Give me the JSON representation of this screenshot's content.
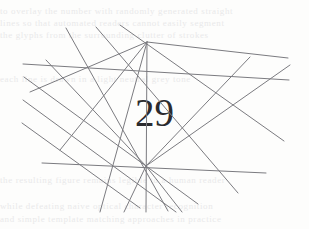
{
  "image": {
    "kind": "captcha-image",
    "width": 309,
    "height": 229,
    "background_color": "#fdfdfc",
    "line_color": "#7b7b80",
    "digit_color": "#2b2b2e",
    "ghost_color": "#e9e9ea",
    "alt_text": "Distorted number obscured by crossing lines"
  },
  "captcha": {
    "value": "29",
    "digit_count": 2
  },
  "ghost_text": {
    "line_1": "to overlay the number with randomly generated straight",
    "line_2": "lines so that automated readers cannot easily segment",
    "line_3": "the glyphs from the surrounding clutter of strokes",
    "line_4": "each line is drawn in a light neutral grey tone",
    "line_5": "the resulting figure remains legible to a human reader",
    "line_6": "while defeating naive optical character recognition",
    "line_7": "and simple template matching approaches in practice"
  },
  "chart_data": {
    "type": "scatter",
    "xlabel": "",
    "ylabel": "",
    "xlim": [
      0,
      309
    ],
    "ylim": [
      0,
      229
    ],
    "grid": false,
    "legend": "none",
    "line_width": 1,
    "line_color": "#7b7b80",
    "segments": [
      {
        "name": "seg-01",
        "x1": 23,
        "y1": 64,
        "x2": 289,
        "y2": 80
      },
      {
        "name": "seg-02",
        "x1": 42,
        "y1": 163,
        "x2": 266,
        "y2": 173
      },
      {
        "name": "seg-03",
        "x1": 24,
        "y1": 77,
        "x2": 198,
        "y2": 204
      },
      {
        "name": "seg-04",
        "x1": 23,
        "y1": 100,
        "x2": 176,
        "y2": 212
      },
      {
        "name": "seg-05",
        "x1": 22,
        "y1": 123,
        "x2": 140,
        "y2": 208
      },
      {
        "name": "seg-06",
        "x1": 66,
        "y1": 28,
        "x2": 168,
        "y2": 211
      },
      {
        "name": "seg-07",
        "x1": 96,
        "y1": 27,
        "x2": 238,
        "y2": 193
      },
      {
        "name": "seg-08",
        "x1": 120,
        "y1": 25,
        "x2": 284,
        "y2": 141
      },
      {
        "name": "seg-09",
        "x1": 147,
        "y1": 42,
        "x2": 288,
        "y2": 58
      },
      {
        "name": "seg-10",
        "x1": 147,
        "y1": 42,
        "x2": 100,
        "y2": 212
      },
      {
        "name": "seg-11",
        "x1": 147,
        "y1": 42,
        "x2": 146,
        "y2": 212
      },
      {
        "name": "seg-12",
        "x1": 147,
        "y1": 42,
        "x2": 60,
        "y2": 150
      },
      {
        "name": "seg-13",
        "x1": 147,
        "y1": 42,
        "x2": 30,
        "y2": 92
      },
      {
        "name": "seg-14",
        "x1": 146,
        "y1": 166,
        "x2": 290,
        "y2": 65
      },
      {
        "name": "seg-15",
        "x1": 146,
        "y1": 166,
        "x2": 46,
        "y2": 60
      },
      {
        "name": "seg-16",
        "x1": 146,
        "y1": 166,
        "x2": 250,
        "y2": 57
      },
      {
        "name": "seg-17",
        "x1": 146,
        "y1": 166,
        "x2": 182,
        "y2": 212
      },
      {
        "name": "seg-18",
        "x1": 146,
        "y1": 166,
        "x2": 124,
        "y2": 212
      }
    ]
  }
}
